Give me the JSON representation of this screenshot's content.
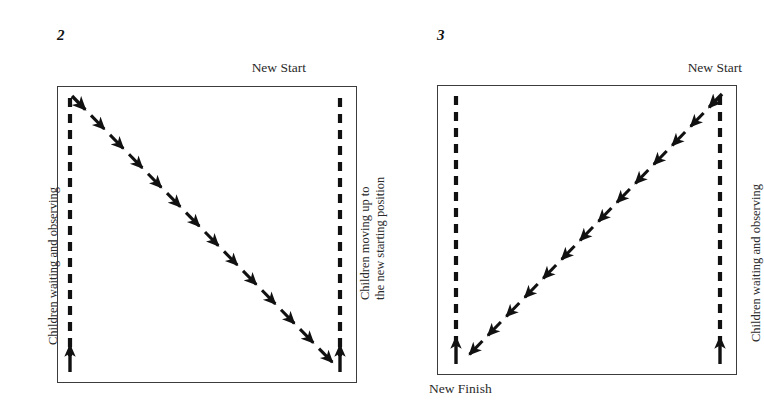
{
  "figure": {
    "background_color": "#ffffff",
    "ink_color": "#111111",
    "box_border_color": "#3c3c3c"
  },
  "panels": [
    {
      "number": "2",
      "number_pos": {
        "x": 57,
        "y": 28
      },
      "box": {
        "x": 57,
        "y": 86,
        "w": 300,
        "h": 297
      },
      "labels": {
        "top_right": "New Start",
        "left_vertical": "Children waiting and observing",
        "right_vertical_line1": "Children moving up to",
        "right_vertical_line2": "the new starting position"
      },
      "diagonal": {
        "direction": "top-left-to-bottom-right",
        "from": {
          "x": 72,
          "y": 96
        },
        "to": {
          "x": 338,
          "y": 368
        },
        "segments": 14,
        "style": "dashed-arrow-chain"
      },
      "dashed_columns": [
        {
          "name": "left-queue",
          "x": 70,
          "y_top": 98,
          "y_bottom": 370,
          "arrow": "up"
        },
        {
          "name": "right-queue",
          "x": 340,
          "y_top": 98,
          "y_bottom": 370,
          "arrow": "up"
        }
      ]
    },
    {
      "number": "3",
      "number_pos": {
        "x": 437,
        "y": 28
      },
      "box": {
        "x": 437,
        "y": 85,
        "w": 300,
        "h": 290
      },
      "labels": {
        "top_right": "New Start",
        "bottom_left": "New Finish",
        "right_vertical": "Children waiting and observing"
      },
      "diagonal": {
        "direction": "top-right-to-bottom-left",
        "from": {
          "x": 722,
          "y": 94
        },
        "to": {
          "x": 464,
          "y": 360
        },
        "segments": 14,
        "style": "dashed-arrow-chain"
      },
      "dashed_columns": [
        {
          "name": "left-queue",
          "x": 456,
          "y_top": 96,
          "y_bottom": 362,
          "arrow": "up"
        },
        {
          "name": "right-queue",
          "x": 720,
          "y_top": 96,
          "y_bottom": 362,
          "arrow": "up"
        }
      ]
    }
  ],
  "common": {
    "new_start": "New Start",
    "new_finish": "New Finish",
    "children_waiting": "Children waiting and observing",
    "children_moving_1": "Children moving up to",
    "children_moving_2": "the new starting position"
  }
}
